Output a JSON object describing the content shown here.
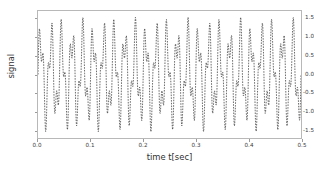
{
  "chart_data": {
    "type": "line",
    "title": "",
    "xlabel": "time t[sec]",
    "ylabel": "signal",
    "xlim": [
      0.0,
      0.5
    ],
    "ylim": [
      -1.72,
      1.72
    ],
    "xticks": [
      "0.0",
      "0.1",
      "0.2",
      "0.3",
      "0.4",
      "0.5"
    ],
    "xtick_values": [
      0.0,
      0.1,
      0.2,
      0.3,
      0.4,
      0.5
    ],
    "yticks": [
      "1.5",
      "1.0",
      "0.5",
      "0.0",
      "-0.5",
      "-1.0",
      "-1.5"
    ],
    "ytick_values": [
      1.5,
      1.0,
      0.5,
      0.0,
      -0.5,
      -1.0,
      -1.5
    ],
    "grid": false,
    "legend": null,
    "line_style": "dashed",
    "line_color": "#2b2b2b",
    "line_width": 0.7,
    "marker": "point",
    "series": [
      {
        "name": "signal",
        "components": [
          {
            "amplitude": 1.0,
            "frequency_hz": 50,
            "phase": 0
          },
          {
            "amplitude": 0.55,
            "frequency_hz": 120,
            "phase": 0
          }
        ],
        "sample_rate_hz": 2000,
        "n_samples": 1000,
        "y_min": -1.55,
        "y_max": 1.55
      }
    ]
  },
  "axes": {
    "frame_color": "#b8b8b8",
    "tick_color": "#9a9a9a",
    "tick_label_color": "#3b3b3b",
    "axis_label_color": "#2e2e2e"
  },
  "figure": {
    "background": "#ffffff"
  }
}
